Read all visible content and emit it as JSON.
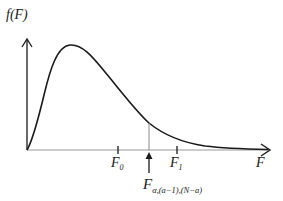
{
  "diagram": {
    "y_axis_label": "f(F)",
    "x_axis_label": "F",
    "ticks": [
      {
        "label_main": "F",
        "label_sub": "0",
        "x": 118
      },
      {
        "label_main": "F",
        "label_sub": "1",
        "x": 177
      }
    ],
    "critical_value": {
      "label_main": "F",
      "label_sub": "α,(a−1),(N−a)",
      "x": 149
    },
    "colors": {
      "line": "#1a1a1a",
      "marker": "#888888",
      "background": "#ffffff"
    }
  }
}
